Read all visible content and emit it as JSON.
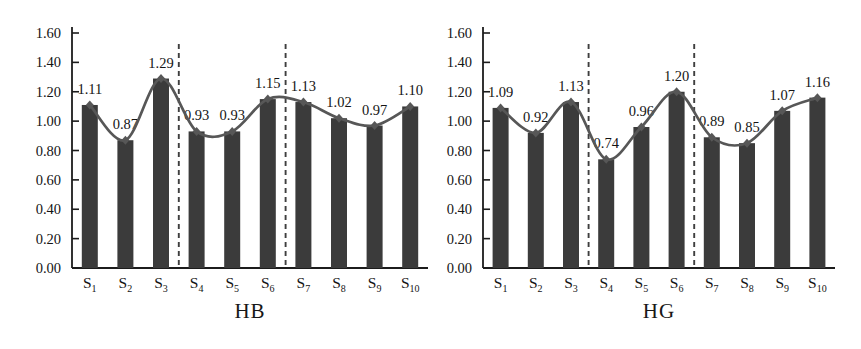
{
  "figure": {
    "background": "#ffffff",
    "text_color": "#141414",
    "axis_color": "#1c1c1c",
    "bar_color": "#3b3b3b",
    "line_color": "#575757",
    "separator_color": "#3f3f3f"
  },
  "chart_data": [
    {
      "type": "bar",
      "title": "HB",
      "categories": [
        "S1",
        "S2",
        "S3",
        "S4",
        "S5",
        "S6",
        "S7",
        "S8",
        "S9",
        "S10"
      ],
      "values": [
        1.11,
        0.87,
        1.29,
        0.93,
        0.93,
        1.15,
        1.13,
        1.02,
        0.97,
        1.1
      ],
      "value_labels": [
        "1.11",
        "0.87",
        "1.29",
        "0.93",
        "0.93",
        "1.15",
        "1.13",
        "1.02",
        "0.97",
        "1.10"
      ],
      "xlabel": "HB",
      "ylabel": "",
      "ylim": [
        0.0,
        1.6
      ],
      "ytick_step": 0.2,
      "ytick_labels": [
        "0.00",
        "0.20",
        "0.40",
        "0.60",
        "0.80",
        "1.00",
        "1.20",
        "1.40",
        "1.60"
      ],
      "separators_after": [
        3,
        6
      ],
      "overlay_line": true,
      "overlay_line_series": "same as values",
      "grid": false,
      "legend": "none"
    },
    {
      "type": "bar",
      "title": "HG",
      "categories": [
        "S1",
        "S2",
        "S3",
        "S4",
        "S5",
        "S6",
        "S7",
        "S8",
        "S9",
        "S10"
      ],
      "values": [
        1.09,
        0.92,
        1.13,
        0.74,
        0.96,
        1.2,
        0.89,
        0.85,
        1.07,
        1.16
      ],
      "value_labels": [
        "1.09",
        "0.92",
        "1.13",
        "0.74",
        "0.96",
        "1.20",
        "0.89",
        "0.85",
        "1.07",
        "1.16"
      ],
      "xlabel": "HG",
      "ylabel": "",
      "ylim": [
        0.0,
        1.6
      ],
      "ytick_step": 0.2,
      "ytick_labels": [
        "0.00",
        "0.20",
        "0.40",
        "0.60",
        "0.80",
        "1.00",
        "1.20",
        "1.40",
        "1.60"
      ],
      "separators_after": [
        3,
        6
      ],
      "overlay_line": true,
      "overlay_line_series": "same as values",
      "grid": false,
      "legend": "none"
    }
  ]
}
